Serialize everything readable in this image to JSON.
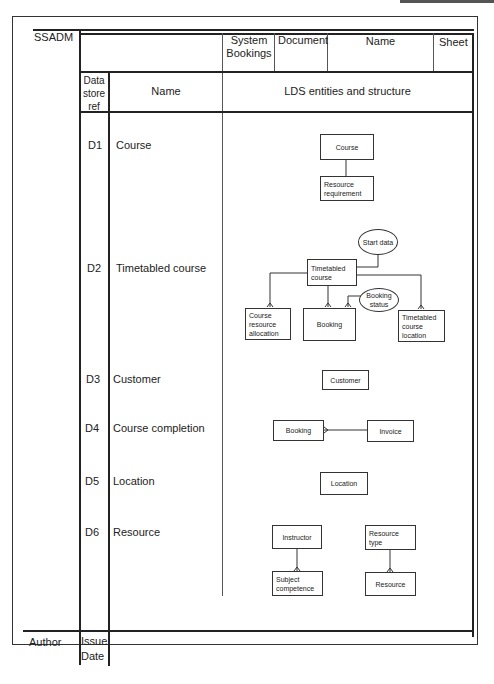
{
  "form": {
    "method": "SSADM",
    "system_label": "System Bookings",
    "document_label": "Document",
    "name_label": "Name",
    "sheet_label": "Sheet",
    "author_label": "Author",
    "issue_date_label": "Issue Date"
  },
  "columns": {
    "ref": "Data store ref",
    "name": "Name",
    "lds": "LDS entities and structure"
  },
  "rows": [
    {
      "ref": "D1",
      "name": "Course"
    },
    {
      "ref": "D2",
      "name": "Timetabled course"
    },
    {
      "ref": "D3",
      "name": "Customer"
    },
    {
      "ref": "D4",
      "name": "Course completion"
    },
    {
      "ref": "D5",
      "name": "Location"
    },
    {
      "ref": "D6",
      "name": "Resource"
    }
  ],
  "entities": {
    "d1": {
      "course": "Course",
      "resource_requirement": "Resource requirement"
    },
    "d2": {
      "start_data": "Start data",
      "timetabled_course": "Timetabled course",
      "booking_status": "Booking status",
      "course_resource_allocation": "Course resource allocation",
      "booking": "Booking",
      "timetabled_course_location": "Timetabled course location"
    },
    "d3": {
      "customer": "Customer"
    },
    "d4": {
      "booking": "Booking",
      "invoice": "Invoice"
    },
    "d5": {
      "location": "Location"
    },
    "d6": {
      "instructor": "Instructor",
      "subject_competence": "Subject competence",
      "resource_type": "Resource type",
      "resource": "Resource"
    }
  }
}
